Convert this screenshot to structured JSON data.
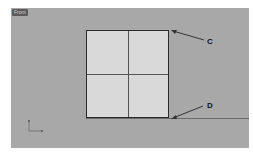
{
  "viewport": {
    "label": "Front",
    "background": "#a8a8a8"
  },
  "square": {
    "fill": "#d9d9d9",
    "grid": "2x2"
  },
  "callouts": [
    {
      "label": "C",
      "points_to": "top-right corner"
    },
    {
      "label": "D",
      "points_to": "bottom-right corner"
    }
  ],
  "axes_icon": "axes-icon"
}
